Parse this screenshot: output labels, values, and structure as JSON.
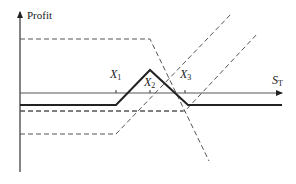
{
  "diagram": {
    "type": "option-payoff",
    "y_axis_label": "Profit",
    "x_axis_label": {
      "main": "S",
      "sub": "T"
    },
    "strikes": [
      {
        "main": "X",
        "sub": "1"
      },
      {
        "main": "X",
        "sub": "2"
      },
      {
        "main": "X",
        "sub": "3"
      }
    ],
    "lines": [
      {
        "name": "total-profit",
        "style": "solid"
      },
      {
        "name": "short-call-x2-top",
        "style": "dashed"
      },
      {
        "name": "short-call-x2-mid",
        "style": "dashed"
      },
      {
        "name": "long-call-x1",
        "style": "dashed"
      },
      {
        "name": "long-call-x3",
        "style": "dashed"
      }
    ],
    "colors": {
      "line": "#222222",
      "dashed": "#555555",
      "axis": "#333333"
    }
  }
}
